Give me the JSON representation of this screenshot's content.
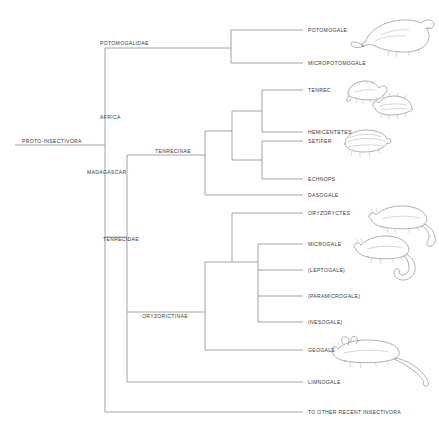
{
  "figure": {
    "type": "cladogram",
    "background_color": "#ffffff",
    "line_color": "#8d8d8d",
    "text_color": "#3a3a3a",
    "width": 439,
    "height": 436
  },
  "root": {
    "label": "PROTO-INSECTIVORA"
  },
  "internal_nodes": [
    {
      "id": "potomogalidae",
      "label": "POTOMOGALIDAE"
    },
    {
      "id": "africa",
      "label": "AFRICA"
    },
    {
      "id": "madagascar",
      "label": "MADAGASCAR"
    },
    {
      "id": "tenrecinae",
      "label": "TENRECINAE"
    },
    {
      "id": "tenrecidae",
      "label": "TENRECIDAE"
    },
    {
      "id": "oryzorictinae",
      "label": "ORYZORICTINAE"
    }
  ],
  "tips": [
    {
      "id": "potomogale",
      "label": "POTOMOGALE",
      "has_illustration": true
    },
    {
      "id": "micropotomogale",
      "label": "MICROPOTOMOGALE",
      "has_illustration": false
    },
    {
      "id": "tenrec",
      "label": "TENREC",
      "has_illustration": true
    },
    {
      "id": "hemicentetes",
      "label": "HEMICENTETES",
      "has_illustration": true
    },
    {
      "id": "setifer",
      "label": "SETIFER",
      "has_illustration": true
    },
    {
      "id": "echnops",
      "label": "ECHNOPS",
      "has_illustration": false
    },
    {
      "id": "dasogale",
      "label": "DASOGALE",
      "has_illustration": false
    },
    {
      "id": "oryzoryctes",
      "label": "ORYZORYCTES",
      "has_illustration": true
    },
    {
      "id": "microgale",
      "label": "MICROGALE",
      "has_illustration": true
    },
    {
      "id": "leptogale",
      "label": "(LEPTOGALE)",
      "has_illustration": false
    },
    {
      "id": "paramicrogale",
      "label": "(PARAMICROGALE)",
      "has_illustration": false
    },
    {
      "id": "nesogale",
      "label": "(NESOGALE)",
      "has_illustration": false
    },
    {
      "id": "geogale",
      "label": "GEOGALE",
      "has_illustration": true
    },
    {
      "id": "limnogale",
      "label": "LIMNOGALE",
      "has_illustration": false
    },
    {
      "id": "other_insectivora",
      "label": "TO OTHER RECENT INSECTIVORA",
      "has_illustration": false
    }
  ],
  "illustrations": [
    {
      "id": "potomogale-illustration",
      "name": "otter-shrew-drawing"
    },
    {
      "id": "tenrec-illustration",
      "name": "tenrec-drawing"
    },
    {
      "id": "hemicentetes-illustration",
      "name": "streaked-tenrec-drawing"
    },
    {
      "id": "setifer-illustration",
      "name": "hedgehog-tenrec-drawing"
    },
    {
      "id": "oryzoryctes-illustration",
      "name": "rice-tenrec-drawing"
    },
    {
      "id": "microgale-illustration",
      "name": "shrew-tenrec-drawing"
    },
    {
      "id": "geogale-illustration",
      "name": "large-eared-tenrec-drawing"
    }
  ]
}
